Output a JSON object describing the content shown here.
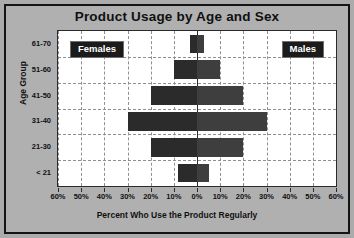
{
  "chart_data": {
    "type": "bar",
    "subtype": "population-pyramid",
    "title": "Product Usage by Age and Sex",
    "xlabel": "Percent Who Use the Product Regularly",
    "ylabel": "Age Group",
    "categories": [
      "61-70",
      "51-60",
      "41-50",
      "31-40",
      "21-30",
      "< 21"
    ],
    "categories_order": "top-to-bottom",
    "series": [
      {
        "name": "Females",
        "side": "left",
        "color": "#2b2b2b",
        "values": [
          3,
          10,
          20,
          30,
          20,
          8
        ]
      },
      {
        "name": "Males",
        "side": "right",
        "color": "#3e3e3e",
        "values": [
          3,
          10,
          20,
          30,
          20,
          5
        ]
      }
    ],
    "xlim": [
      -60,
      60
    ],
    "xticks": [
      "60%",
      "50%",
      "40%",
      "30%",
      "20%",
      "10%",
      "0%",
      "10%",
      "20%",
      "30%",
      "40%",
      "50%",
      "60%"
    ],
    "xtick_values": [
      -60,
      -50,
      -40,
      -30,
      -20,
      -10,
      0,
      10,
      20,
      30,
      40,
      50,
      60
    ],
    "grid": true,
    "grid_style": "dashed",
    "legend": "inline-labels",
    "legend_position": "top-left and top-right inside plot"
  },
  "labels": {
    "females": "Females",
    "males": "Males"
  },
  "colors": {
    "background": "#ababab",
    "plot_background": "#ffffff",
    "frame": "#141414",
    "female_bar": "#2b2b2b",
    "male_bar": "#3e3e3e",
    "gridline": "#8f8f8f",
    "text": "#101010",
    "legend_box": "#1b1b1b",
    "legend_text": "#ffffff"
  }
}
